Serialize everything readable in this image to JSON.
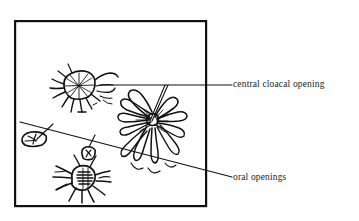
{
  "figure": {
    "type": "scientific-line-illustration",
    "background_color": "#ffffff",
    "ink_color": "#111111",
    "frame": {
      "name": "illustration-border",
      "x": 14,
      "y": 20,
      "width": 193,
      "height": 187,
      "stroke_color": "#111111",
      "stroke_width": 2.2
    },
    "labels": [
      {
        "id": "cloacal",
        "text": "central cloacal opening",
        "x": 233,
        "y": 80,
        "leader": "horizontal-line-with-branch-to-central-zooid"
      },
      {
        "id": "oral",
        "text": "oral openings",
        "x": 233,
        "y": 173,
        "leader": "long-diagonal-line-to-small-zooids"
      }
    ],
    "organisms": [
      {
        "id": "upper-left-zooid",
        "name": "upper-left-radiating-zooid",
        "cx": 78,
        "cy": 88
      },
      {
        "id": "central-colony",
        "name": "central-lobed-colony",
        "cx": 152,
        "cy": 122
      },
      {
        "id": "lower-left-zooid",
        "name": "lower-left-radiating-zooid",
        "cx": 82,
        "cy": 180
      },
      {
        "id": "small-oval-left",
        "name": "small-oval-zooid-left",
        "cx": 33,
        "cy": 140
      },
      {
        "id": "small-oval-mid",
        "name": "small-oval-zooid-middle",
        "cx": 88,
        "cy": 155
      }
    ]
  }
}
